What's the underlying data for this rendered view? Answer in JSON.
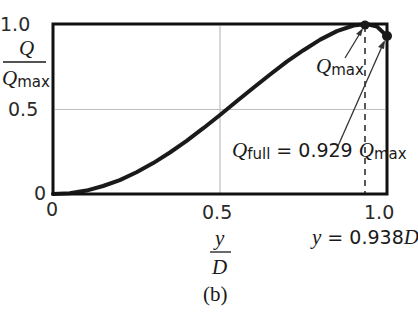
{
  "chart_data": {
    "type": "line",
    "title": "",
    "panel_label": "(b)",
    "xlabel": "y/D",
    "ylabel": "Q/Qmax",
    "xlim": [
      0,
      1.0
    ],
    "ylim": [
      0,
      1.0
    ],
    "x_ticks": [
      "0",
      "0.5",
      "1.0"
    ],
    "y_ticks": [
      "0",
      "0.5",
      "1.0"
    ],
    "grid": "x=0.5 and y=0.5 only",
    "series": [
      {
        "name": "Q/Qmax",
        "x": [
          0,
          0.05,
          0.1,
          0.15,
          0.2,
          0.25,
          0.3,
          0.35,
          0.4,
          0.45,
          0.5,
          0.55,
          0.6,
          0.65,
          0.7,
          0.75,
          0.8,
          0.85,
          0.9,
          0.938,
          0.97,
          1.0
        ],
        "y": [
          0,
          0.005,
          0.02,
          0.047,
          0.082,
          0.128,
          0.182,
          0.244,
          0.313,
          0.387,
          0.465,
          0.545,
          0.625,
          0.703,
          0.778,
          0.846,
          0.908,
          0.958,
          0.991,
          1.0,
          0.985,
          0.929
        ]
      }
    ],
    "annotations": [
      {
        "text": "Q_max",
        "point": [
          0.938,
          1.0
        ]
      },
      {
        "text": "Q_full = 0.929 Q_max",
        "point": [
          1.0,
          0.929
        ]
      },
      {
        "text": "y = 0.938D",
        "x": 0.938,
        "style": "dashed vertical line"
      }
    ]
  },
  "labels": {
    "y_tick_top": "1.0",
    "y_tick_mid": "0.5",
    "y_tick_bottom": "0",
    "x_tick_left": "0",
    "x_tick_mid": "0.5",
    "x_tick_right": "1.0",
    "y_axis_num": "Q",
    "y_axis_den": "Q",
    "y_axis_den_sub": "max",
    "x_axis_num": "y",
    "x_axis_den": "D",
    "panel": "(b)",
    "qmax_sym": "Q",
    "qmax_sub": "max",
    "qfull_sym": "Q",
    "qfull_sub": "full",
    "qfull_eq": " = 0.929 ",
    "qfull_sym2": "Q",
    "qfull_sub2": "max",
    "ymax_lhs": "y",
    "ymax_eq": " = 0.938",
    "ymax_D": "D"
  },
  "colors": {
    "curve": "#1a1a1a",
    "frame": "#111111",
    "grid": "#b8b8b8",
    "text": "#1a1a1a"
  }
}
